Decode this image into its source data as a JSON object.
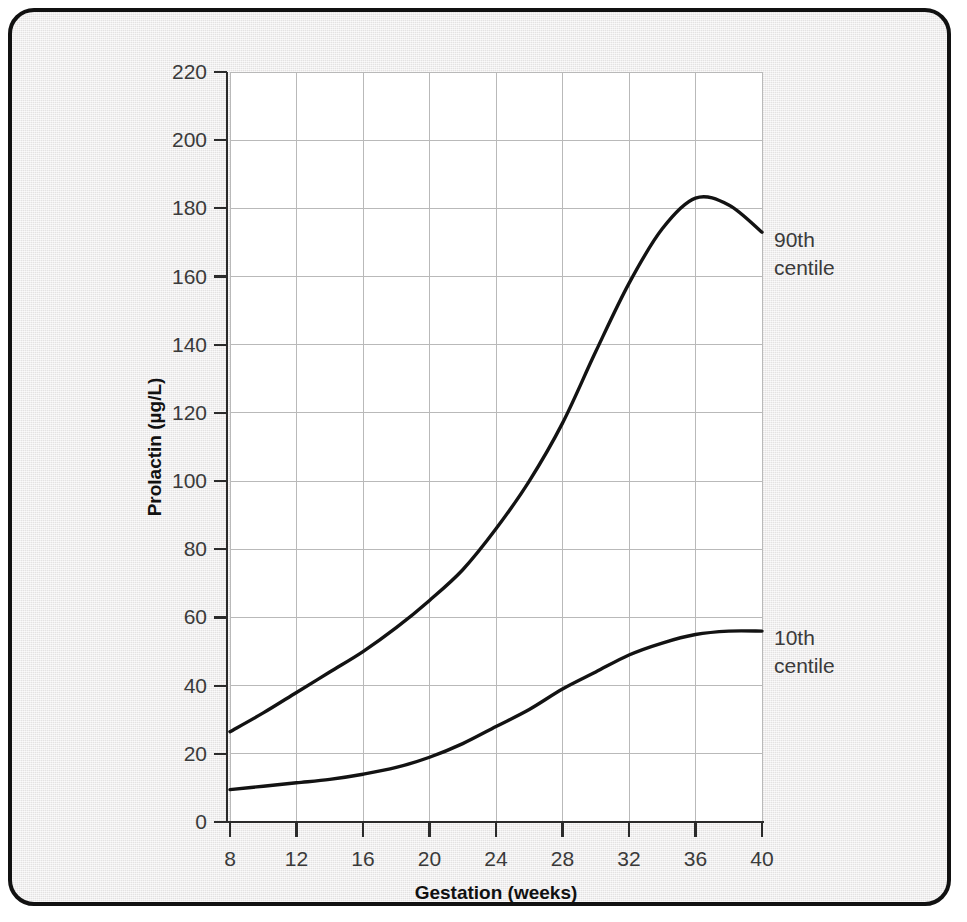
{
  "chart_data": {
    "type": "line",
    "title": "",
    "xlabel": "Gestation (weeks)",
    "ylabel": "Prolactin (µg/L)",
    "xlim": [
      8,
      40
    ],
    "ylim": [
      0,
      220
    ],
    "xticks": [
      8,
      12,
      16,
      20,
      24,
      28,
      32,
      36,
      40
    ],
    "yticks": [
      0,
      20,
      40,
      60,
      80,
      100,
      120,
      140,
      160,
      180,
      200,
      220
    ],
    "grid": true,
    "legend_position": "right-inline-annotations",
    "x": [
      8,
      10,
      12,
      14,
      16,
      18,
      20,
      22,
      24,
      26,
      28,
      30,
      32,
      34,
      36,
      38,
      40
    ],
    "series": [
      {
        "name": "90th centile",
        "label_line1": "90th",
        "label_line2": "centile",
        "color": "#131313",
        "values": [
          26.5,
          32,
          38,
          44,
          50,
          57,
          65,
          74,
          86,
          100,
          117,
          138,
          158,
          174,
          183,
          181,
          173
        ]
      },
      {
        "name": "10th centile",
        "label_line1": "10th",
        "label_line2": "centile",
        "color": "#131313",
        "values": [
          9.5,
          10.5,
          11.5,
          12.5,
          14,
          16,
          19,
          23,
          28,
          33,
          39,
          44,
          49,
          52.5,
          55,
          56,
          56
        ]
      }
    ]
  },
  "axes": {
    "x_tick_labels": [
      "8",
      "12",
      "16",
      "20",
      "24",
      "28",
      "32",
      "36",
      "40"
    ],
    "y_tick_labels": [
      "0",
      "20",
      "40",
      "60",
      "80",
      "100",
      "120",
      "140",
      "160",
      "180",
      "200",
      "220"
    ],
    "x_axis_title": "Gestation (weeks)",
    "y_axis_title": "Prolactin (µg/L)"
  },
  "annotations": [
    {
      "name": "label-90th-centile",
      "line1": "90th",
      "line2": "centile"
    },
    {
      "name": "label-10th-centile",
      "line1": "10th",
      "line2": "centile"
    }
  ],
  "colors": {
    "frame_border": "#111111",
    "page_background": "#eceaea",
    "plot_background": "#ffffff",
    "grid": "#b9b9b9",
    "axis": "#2b2b2b",
    "curve": "#131313",
    "text": "#3a3a3a"
  }
}
